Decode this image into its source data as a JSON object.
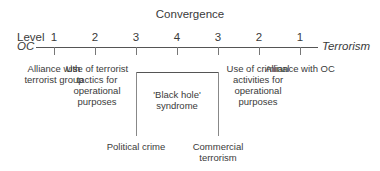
{
  "diagram": {
    "title": "Convergence",
    "level_label": "Level",
    "left_end": "OC",
    "right_end": "Terrorism",
    "levels": [
      "1",
      "2",
      "3",
      "4",
      "3",
      "2",
      "1"
    ],
    "descriptions": [
      "Alliance with terrorist group",
      "Use of terrorist tactics for operational purposes",
      "Use of criminal activities for operational purposes",
      "Alliance with OC"
    ],
    "black_hole": "'Black hole' syndrome",
    "bottom_left": "Political crime",
    "bottom_right": "Commercial terrorism"
  }
}
